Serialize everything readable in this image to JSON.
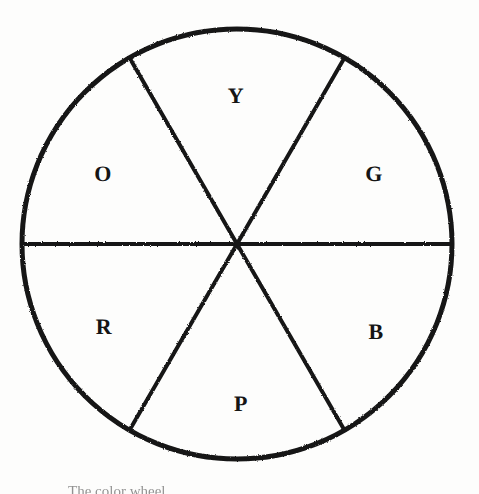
{
  "figure": {
    "kind": "color-wheel-diagram",
    "title": "Color Wheel",
    "background_color": "#fdfdfc",
    "ink_color": "#151515",
    "caption_text": "The color wheel.",
    "caption_visibility": "cropped at bottom edge, only tops of letters visible"
  },
  "wheel": {
    "center_x": 237,
    "center_y": 244,
    "radius": 215,
    "outline_stroke_width": 5,
    "divider_stroke_width": 4,
    "sector_count": 6,
    "sector_arc_degrees": 60,
    "dividers": [
      {
        "name": "horizontal-diameter",
        "angle_degrees": 0
      },
      {
        "name": "upper-left-to-lower-right-diameter",
        "angle_degrees": 60
      },
      {
        "name": "upper-right-to-lower-left-diameter",
        "angle_degrees": 120
      }
    ],
    "sectors": [
      {
        "key": "yellow",
        "label": "Y",
        "color_name": "Yellow",
        "position": "top",
        "start_angle_degrees": 60,
        "end_angle_degrees": 120,
        "label_x": 236,
        "label_y": 96
      },
      {
        "key": "orange",
        "label": "O",
        "color_name": "Orange",
        "position": "upper-left",
        "start_angle_degrees": 120,
        "end_angle_degrees": 180,
        "label_x": 103,
        "label_y": 174
      },
      {
        "key": "green",
        "label": "G",
        "color_name": "Green",
        "position": "upper-right",
        "start_angle_degrees": 0,
        "end_angle_degrees": 60,
        "label_x": 374,
        "label_y": 174
      },
      {
        "key": "red",
        "label": "R",
        "color_name": "Red",
        "position": "lower-left",
        "start_angle_degrees": 180,
        "end_angle_degrees": 240,
        "label_x": 104,
        "label_y": 327
      },
      {
        "key": "blue",
        "label": "B",
        "color_name": "Blue",
        "position": "lower-right",
        "start_angle_degrees": 300,
        "end_angle_degrees": 360,
        "label_x": 376,
        "label_y": 332
      },
      {
        "key": "purple",
        "label": "P",
        "color_name": "Purple",
        "position": "bottom",
        "start_angle_degrees": 240,
        "end_angle_degrees": 300,
        "label_x": 241,
        "label_y": 404
      }
    ]
  }
}
